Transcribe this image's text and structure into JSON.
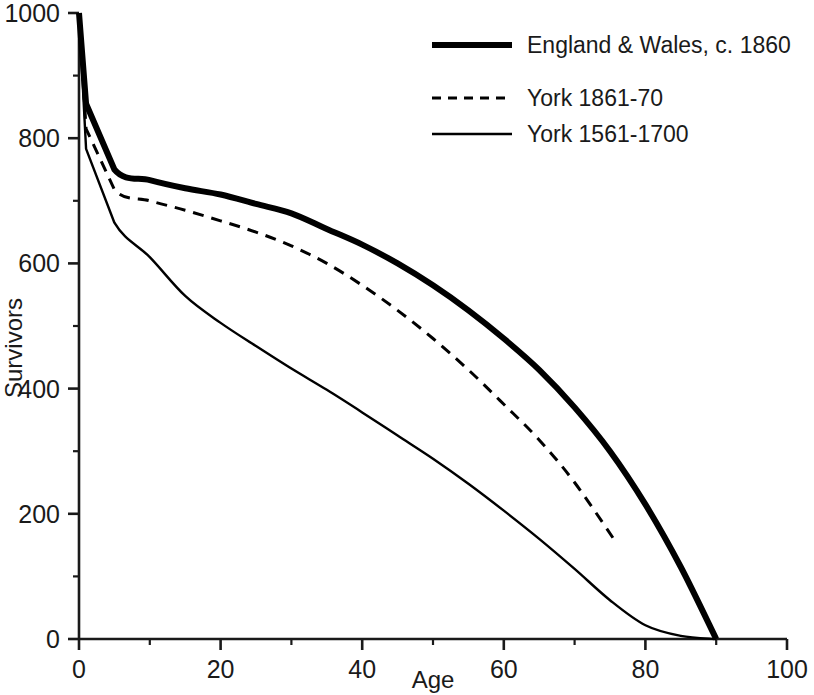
{
  "chart_data": {
    "type": "line",
    "title": "",
    "xlabel": "Age",
    "ylabel": "Survivors",
    "xlim": [
      0,
      100
    ],
    "ylim": [
      0,
      1000
    ],
    "xticks": [
      0,
      20,
      40,
      60,
      80,
      100
    ],
    "xtick_labels": [
      "0",
      "20",
      "40",
      "60",
      "80",
      "100"
    ],
    "xminor_ticks": [
      10,
      30,
      50,
      70,
      90
    ],
    "yticks": [
      0,
      200,
      400,
      600,
      800,
      1000
    ],
    "ytick_labels": [
      "0",
      "200",
      "400",
      "600",
      "800",
      "1000"
    ],
    "yminor_ticks": [
      100,
      300,
      500,
      700,
      900
    ],
    "grid": false,
    "legend_position": "top-right",
    "series": [
      {
        "name": "England & Wales, c. 1860",
        "style": "solid-thick",
        "color": "#000000",
        "width": 6,
        "x": [
          0,
          1,
          5,
          10,
          15,
          20,
          25,
          30,
          35,
          40,
          45,
          50,
          55,
          60,
          65,
          70,
          75,
          80,
          85,
          90
        ],
        "y": [
          1000,
          855,
          750,
          733,
          720,
          710,
          695,
          680,
          655,
          630,
          600,
          565,
          525,
          480,
          430,
          370,
          300,
          215,
          115,
          0
        ]
      },
      {
        "name": "York 1861-70",
        "style": "dashed",
        "color": "#000000",
        "width": 3,
        "x": [
          0,
          1,
          5,
          10,
          15,
          20,
          25,
          30,
          35,
          40,
          45,
          50,
          55,
          60,
          65,
          70,
          76
        ],
        "y": [
          1000,
          815,
          718,
          700,
          685,
          668,
          650,
          628,
          600,
          565,
          525,
          480,
          430,
          375,
          318,
          250,
          152
        ]
      },
      {
        "name": "York 1561-1700",
        "style": "solid-thin",
        "color": "#000000",
        "width": 2.4,
        "x": [
          0,
          1,
          5,
          10,
          15,
          20,
          25,
          30,
          35,
          40,
          45,
          50,
          55,
          60,
          65,
          70,
          75,
          80,
          85,
          90
        ],
        "y": [
          1000,
          783,
          665,
          610,
          548,
          505,
          468,
          432,
          398,
          362,
          325,
          288,
          248,
          205,
          160,
          112,
          62,
          22,
          5,
          0
        ]
      }
    ]
  },
  "legend": {
    "items": [
      {
        "label": "England & Wales, c. 1860",
        "style": "solid-thick"
      },
      {
        "label": "York 1861-70",
        "style": "dashed"
      },
      {
        "label": "York 1561-1700",
        "style": "solid-thin"
      }
    ]
  },
  "axes": {
    "x_title": "Age",
    "y_title": "Survivors"
  }
}
